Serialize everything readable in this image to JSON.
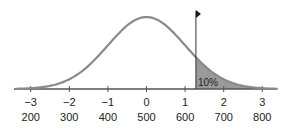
{
  "chart_data": {
    "type": "area",
    "title": "",
    "xlabel": "",
    "ylabel": "",
    "z_ticks": [
      "−3",
      "−2",
      "−1",
      "0",
      "1",
      "2",
      "3"
    ],
    "score_ticks": [
      "200",
      "300",
      "400",
      "500",
      "600",
      "700",
      "800"
    ],
    "z_values": [
      -3,
      -2,
      -1,
      0,
      1,
      2,
      3
    ],
    "score_values": [
      200,
      300,
      400,
      500,
      600,
      700,
      800
    ],
    "mean": 500,
    "sd": 100,
    "cutoff_z": 1.28,
    "cutoff_score": 628,
    "shaded_region": "upper tail",
    "shaded_label": "10%",
    "xlim_z": [
      -3.4,
      3.4
    ],
    "grid": false,
    "legend": "none",
    "marker": "flag at cutoff line",
    "colors": {
      "curve": "#8a8a8a",
      "shade": "#9a9a9a",
      "axis": "#555555",
      "line": "#333333",
      "flag": "#1a1a1a"
    }
  }
}
